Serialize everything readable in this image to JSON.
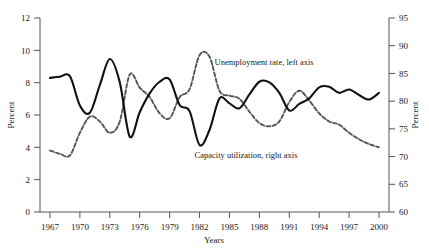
{
  "chart_data": {
    "type": "line",
    "title": "",
    "xlabel": "Years",
    "ylabel": "Percent",
    "ylabel_right": "Percent",
    "xlim": [
      1966,
      2001
    ],
    "ylim": [
      0,
      12
    ],
    "ylim_right": [
      60,
      95
    ],
    "grid": false,
    "legend_position": "inline-annotation",
    "xticks": [
      "1967",
      "1970",
      "1973",
      "1976",
      "1979",
      "1982",
      "1985",
      "1988",
      "1991",
      "1994",
      "1997",
      "2000"
    ],
    "yticks_left": [
      "0",
      "2",
      "4",
      "6",
      "8",
      "10",
      "12"
    ],
    "yticks_right": [
      "60",
      "65",
      "70",
      "75",
      "80",
      "85",
      "90",
      "95"
    ],
    "annotations": [
      {
        "text": "Unemployment rate, left axis",
        "x": 1983.5,
        "y": 9.3
      },
      {
        "text": "Capacity utilization, right axis",
        "x": 1981.5,
        "y": 3.5
      }
    ],
    "series": [
      {
        "name": "Unemployment rate, left axis",
        "axis": "left",
        "style": "dashed",
        "color": "#555555",
        "x": [
          1967,
          1968,
          1969,
          1970,
          1971,
          1972,
          1973,
          1974,
          1975,
          1976,
          1977,
          1978,
          1979,
          1980,
          1981,
          1982,
          1983,
          1984,
          1985,
          1986,
          1987,
          1988,
          1989,
          1990,
          1991,
          1992,
          1993,
          1994,
          1995,
          1996,
          1997,
          1998,
          1999,
          2000
        ],
        "values": [
          3.8,
          3.6,
          3.5,
          4.9,
          5.9,
          5.6,
          4.9,
          5.6,
          8.5,
          7.7,
          7.1,
          6.1,
          5.8,
          7.1,
          7.6,
          9.7,
          9.6,
          7.5,
          7.2,
          7.0,
          6.2,
          5.5,
          5.3,
          5.6,
          6.8,
          7.5,
          6.9,
          6.1,
          5.6,
          5.4,
          4.9,
          4.5,
          4.2,
          4.0
        ]
      },
      {
        "name": "Capacity utilization, right axis",
        "axis": "right",
        "style": "solid",
        "color": "#111111",
        "x": [
          1967,
          1968,
          1969,
          1970,
          1971,
          1972,
          1973,
          1974,
          1975,
          1976,
          1977,
          1978,
          1979,
          1980,
          1981,
          1982,
          1983,
          1984,
          1985,
          1986,
          1987,
          1988,
          1989,
          1990,
          1991,
          1992,
          1993,
          1994,
          1995,
          1996,
          1997,
          1998,
          1999,
          2000
        ],
        "values": [
          84.2,
          84.4,
          84.5,
          79.2,
          77.9,
          82.9,
          87.6,
          83.4,
          73.6,
          78.0,
          81.4,
          83.5,
          83.9,
          79.3,
          78.2,
          72.1,
          74.8,
          80.5,
          79.6,
          78.7,
          81.2,
          83.5,
          83.4,
          81.5,
          78.3,
          79.5,
          80.5,
          82.5,
          82.6,
          81.5,
          82.1,
          81.1,
          80.3,
          81.5
        ]
      }
    ]
  },
  "axes": {
    "left_label": "Percent",
    "right_label": "Percent",
    "x_label": "Years"
  }
}
